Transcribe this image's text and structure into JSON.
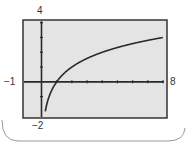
{
  "chart_data": {
    "type": "line",
    "title": "",
    "xlabel": "",
    "ylabel": "",
    "xlim": [
      -1,
      8
    ],
    "ylim": [
      -2,
      4
    ],
    "xticks": [
      1,
      2,
      3,
      4,
      5,
      6,
      7,
      8
    ],
    "yticks": [
      -1,
      1,
      2,
      3,
      4
    ],
    "grid": false,
    "legend": null,
    "window_labels": {
      "xmin": "−1",
      "xmax": "8",
      "ymin": "−2",
      "ymax": "4"
    },
    "series": [
      {
        "name": "y = log2(x)",
        "x": [
          0.25,
          0.5,
          0.75,
          1,
          1.5,
          2,
          3,
          4,
          5,
          6,
          7,
          8
        ],
        "values": [
          -2,
          -1,
          -0.415,
          0,
          0.585,
          1,
          1.585,
          2,
          2.322,
          2.585,
          2.807,
          3
        ]
      }
    ]
  },
  "colors": {
    "screen_fill": "#e4e4e4",
    "frame": "#333333",
    "axes": "#2a2a2a",
    "curve": "#2a2a2a",
    "card_border": "#9a9a9a",
    "label": "#333333"
  }
}
